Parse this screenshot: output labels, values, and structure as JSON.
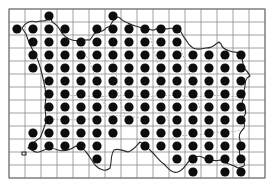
{
  "map": {
    "type": "distribution-grid-map",
    "grid": {
      "cols": 16,
      "rows": 13,
      "origin_x": 9,
      "origin_y": 9,
      "cell_w": 16,
      "cell_h": 13
    },
    "colors": {
      "background": "#ffffff",
      "grid": "#8a8a8a",
      "coastline": "#2a2a2a",
      "dot": "#0d0d0d"
    },
    "occupied_cells": [
      {
        "row": 0,
        "cols": [
          2,
          6
        ]
      },
      {
        "row": 1,
        "cols": [
          0,
          1,
          2,
          3,
          5,
          6,
          7,
          8,
          9,
          10
        ]
      },
      {
        "row": 2,
        "cols": [
          1,
          2,
          3,
          4,
          5,
          6,
          7,
          8,
          9,
          10
        ]
      },
      {
        "row": 3,
        "cols": [
          1,
          2,
          3,
          4,
          5,
          6,
          7,
          8,
          9,
          10,
          11,
          12,
          13,
          14
        ]
      },
      {
        "row": 4,
        "cols": [
          1,
          2,
          3,
          4,
          5,
          6,
          7,
          8,
          9,
          10,
          11,
          12,
          13,
          14
        ]
      },
      {
        "row": 5,
        "cols": [
          2,
          3,
          4,
          5,
          6,
          7,
          8,
          9,
          10,
          11,
          12,
          13,
          14
        ]
      },
      {
        "row": 6,
        "cols": [
          2,
          3,
          4,
          5,
          6,
          7,
          8,
          9,
          10,
          11,
          12,
          13,
          14
        ]
      },
      {
        "row": 7,
        "cols": [
          2,
          3,
          4,
          5,
          6,
          7,
          8,
          9,
          10,
          11,
          12,
          13,
          14
        ]
      },
      {
        "row": 8,
        "cols": [
          2,
          3,
          4,
          5,
          6,
          7,
          8,
          9,
          10,
          11,
          12,
          13,
          14
        ]
      },
      {
        "row": 9,
        "cols": [
          1,
          2,
          3,
          4,
          5,
          6,
          8,
          9,
          10,
          11,
          12,
          13
        ]
      },
      {
        "row": 10,
        "cols": [
          1,
          2,
          3,
          4,
          5,
          8,
          9,
          10,
          11,
          12,
          13,
          14
        ]
      },
      {
        "row": 11,
        "cols": [
          5,
          10,
          11,
          12,
          13,
          14
        ]
      },
      {
        "row": 12,
        "cols": [
          11,
          13,
          14
        ]
      }
    ]
  }
}
